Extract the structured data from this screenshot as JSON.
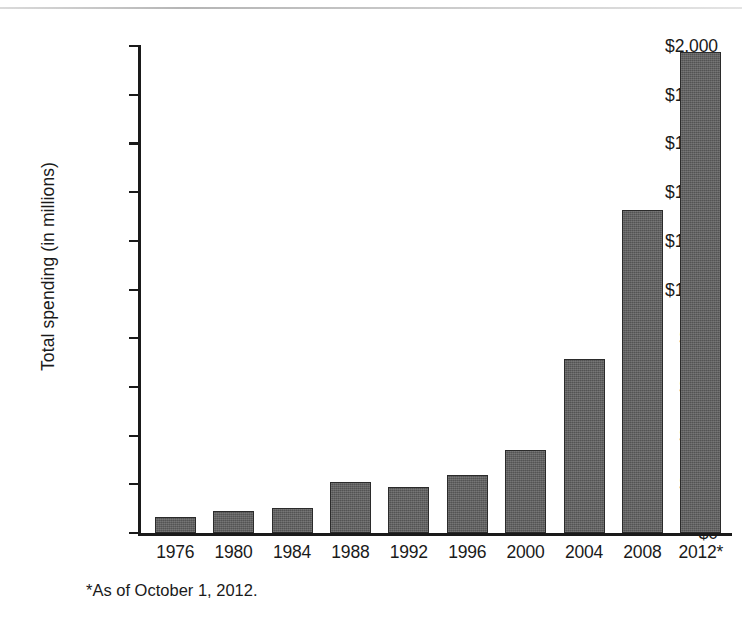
{
  "chart_data": {
    "type": "bar",
    "title": "",
    "subtitle": "",
    "xlabel": "",
    "ylabel": "Total spending (in millions)",
    "categories": [
      "1976",
      "1980",
      "1984",
      "1988",
      "1992",
      "1996",
      "2000",
      "2004",
      "2008",
      "2012*"
    ],
    "values": [
      65,
      90,
      103,
      210,
      190,
      240,
      340,
      715,
      1325,
      1975
    ],
    "value_prefix": "$",
    "ylim": [
      0,
      2000
    ],
    "ytick_values": [
      0,
      200,
      400,
      600,
      800,
      1000,
      1200,
      1400,
      1600,
      1800,
      2000
    ],
    "ytick_labels": [
      "$0",
      "$200",
      "$400",
      "$600",
      "$800",
      "$1,000",
      "$1,200",
      "$1,400",
      "$1,600",
      "$1,800",
      "$2,000"
    ],
    "grid": false,
    "legend": null,
    "legend_position": "none",
    "bar_color": "#5b5b5b",
    "bar_edge_color": "#2b2b2b",
    "axis_color": "#1a1a1a",
    "background_color": "#ffffff",
    "annotations": [
      "*As of October 1, 2012."
    ]
  },
  "footnote": {
    "text": "*As of October 1, 2012."
  },
  "axes": {
    "y_title": "Total spending (in millions)"
  }
}
